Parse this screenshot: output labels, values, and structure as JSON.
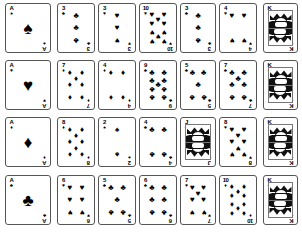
{
  "scene": {
    "title": "Playing card deck sample sheet",
    "background_color": "#ffffff",
    "ink_color": "#000000",
    "border_color": "#555555",
    "grid_columns": 7,
    "grid_rows": 4
  },
  "suit_glyphs": {
    "spades": "♠",
    "hearts": "♥",
    "diamonds": "♦",
    "clubs": "♣"
  },
  "cards": [
    {
      "id": "r1c1",
      "rank": "A",
      "suit": "spades",
      "suit_glyph": "♠",
      "pip_count": 1,
      "face": false,
      "x": 5,
      "y": 3,
      "w": 46,
      "h": 50
    },
    {
      "id": "r1c2",
      "rank": "3",
      "suit": "clubs",
      "suit_glyph": "♣",
      "pip_count": 3,
      "face": false,
      "x": 57,
      "y": 3,
      "w": 38,
      "h": 50
    },
    {
      "id": "r1c3",
      "rank": "3",
      "suit": "hearts",
      "suit_glyph": "♥",
      "pip_count": 3,
      "face": false,
      "x": 98,
      "y": 3,
      "w": 38,
      "h": 50
    },
    {
      "id": "r1c4",
      "rank": "10",
      "suit": "hearts",
      "suit_glyph": "♥",
      "pip_count": 10,
      "face": false,
      "x": 139,
      "y": 3,
      "w": 38,
      "h": 50
    },
    {
      "id": "r1c5",
      "rank": "3",
      "suit": "clubs",
      "suit_glyph": "♣",
      "pip_count": 3,
      "face": false,
      "x": 180,
      "y": 3,
      "w": 36,
      "h": 50
    },
    {
      "id": "r1c6",
      "rank": "4",
      "suit": "hearts",
      "suit_glyph": "♥",
      "pip_count": 4,
      "face": false,
      "x": 219,
      "y": 3,
      "w": 38,
      "h": 50
    },
    {
      "id": "r1c7",
      "rank": "K",
      "suit": "clubs",
      "suit_glyph": "♣",
      "pip_count": 0,
      "face": true,
      "x": 263,
      "y": 3,
      "w": 35,
      "h": 50
    },
    {
      "id": "r2c1",
      "rank": "A",
      "suit": "hearts",
      "suit_glyph": "♥",
      "pip_count": 1,
      "face": false,
      "x": 5,
      "y": 60,
      "w": 46,
      "h": 50
    },
    {
      "id": "r2c2",
      "rank": "7",
      "suit": "diamonds",
      "suit_glyph": "♦",
      "pip_count": 7,
      "face": false,
      "x": 57,
      "y": 60,
      "w": 38,
      "h": 50
    },
    {
      "id": "r2c3",
      "rank": "4",
      "suit": "diamonds",
      "suit_glyph": "♦",
      "pip_count": 4,
      "face": false,
      "x": 98,
      "y": 60,
      "w": 38,
      "h": 50
    },
    {
      "id": "r2c4",
      "rank": "9",
      "suit": "clubs",
      "suit_glyph": "♣",
      "pip_count": 9,
      "face": false,
      "x": 139,
      "y": 60,
      "w": 38,
      "h": 50
    },
    {
      "id": "r2c5",
      "rank": "5",
      "suit": "clubs",
      "suit_glyph": "♣",
      "pip_count": 5,
      "face": false,
      "x": 180,
      "y": 60,
      "w": 36,
      "h": 50
    },
    {
      "id": "r2c6",
      "rank": "7",
      "suit": "clubs",
      "suit_glyph": "♣",
      "pip_count": 7,
      "face": false,
      "x": 219,
      "y": 60,
      "w": 38,
      "h": 50
    },
    {
      "id": "r2c7",
      "rank": "K",
      "suit": "clubs",
      "suit_glyph": "♣",
      "pip_count": 0,
      "face": true,
      "x": 263,
      "y": 60,
      "w": 35,
      "h": 50
    },
    {
      "id": "r3c1",
      "rank": "A",
      "suit": "diamonds",
      "suit_glyph": "♦",
      "pip_count": 1,
      "face": false,
      "x": 5,
      "y": 117,
      "w": 46,
      "h": 50
    },
    {
      "id": "r3c2",
      "rank": "8",
      "suit": "diamonds",
      "suit_glyph": "♦",
      "pip_count": 8,
      "face": false,
      "x": 57,
      "y": 117,
      "w": 38,
      "h": 50
    },
    {
      "id": "r3c3",
      "rank": "2",
      "suit": "spades",
      "suit_glyph": "♠",
      "pip_count": 2,
      "face": false,
      "x": 98,
      "y": 117,
      "w": 38,
      "h": 50
    },
    {
      "id": "r3c4",
      "rank": "4",
      "suit": "clubs",
      "suit_glyph": "♣",
      "pip_count": 4,
      "face": false,
      "x": 139,
      "y": 117,
      "w": 38,
      "h": 50
    },
    {
      "id": "r3c5",
      "rank": "J",
      "suit": "clubs",
      "suit_glyph": "♣",
      "pip_count": 0,
      "face": true,
      "x": 180,
      "y": 117,
      "w": 36,
      "h": 50
    },
    {
      "id": "r3c6",
      "rank": "8",
      "suit": "hearts",
      "suit_glyph": "♥",
      "pip_count": 8,
      "face": false,
      "x": 219,
      "y": 117,
      "w": 38,
      "h": 50
    },
    {
      "id": "r3c7",
      "rank": "K",
      "suit": "clubs",
      "suit_glyph": "♣",
      "pip_count": 0,
      "face": true,
      "x": 263,
      "y": 117,
      "w": 35,
      "h": 50
    },
    {
      "id": "r4c1",
      "rank": "A",
      "suit": "clubs",
      "suit_glyph": "♣",
      "pip_count": 1,
      "face": false,
      "x": 5,
      "y": 175,
      "w": 46,
      "h": 50
    },
    {
      "id": "r4c2",
      "rank": "6",
      "suit": "hearts",
      "suit_glyph": "♥",
      "pip_count": 6,
      "face": false,
      "x": 57,
      "y": 175,
      "w": 38,
      "h": 50
    },
    {
      "id": "r4c3",
      "rank": "5",
      "suit": "clubs",
      "suit_glyph": "♣",
      "pip_count": 5,
      "face": false,
      "x": 98,
      "y": 175,
      "w": 38,
      "h": 50
    },
    {
      "id": "r4c4",
      "rank": "6",
      "suit": "clubs",
      "suit_glyph": "♣",
      "pip_count": 6,
      "face": false,
      "x": 139,
      "y": 175,
      "w": 38,
      "h": 50
    },
    {
      "id": "r4c5",
      "rank": "7",
      "suit": "hearts",
      "suit_glyph": "♥",
      "pip_count": 7,
      "face": false,
      "x": 180,
      "y": 175,
      "w": 36,
      "h": 50
    },
    {
      "id": "r4c6",
      "rank": "10",
      "suit": "diamonds",
      "suit_glyph": "♦",
      "pip_count": 10,
      "face": false,
      "x": 219,
      "y": 175,
      "w": 38,
      "h": 50
    },
    {
      "id": "r4c7",
      "rank": "K",
      "suit": "clubs",
      "suit_glyph": "♣",
      "pip_count": 0,
      "face": true,
      "x": 263,
      "y": 175,
      "w": 35,
      "h": 50
    }
  ]
}
